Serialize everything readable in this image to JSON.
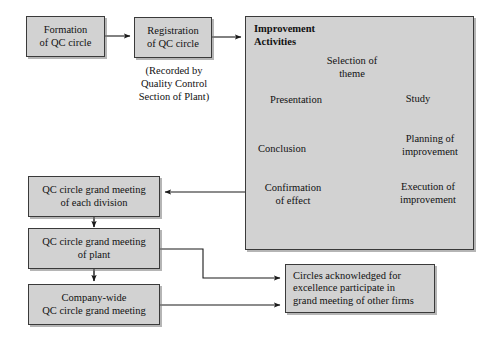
{
  "diagram": {
    "colors": {
      "box_fill": "#d2d2d2",
      "box_border": "#3a3a3a",
      "arrow": "#1a1a1a",
      "background": "#ffffff"
    }
  },
  "boxes": {
    "formation": "Formation\nof QC circle",
    "registration": "Registration\nof QC circle",
    "note_registration": "(Recorded by\nQuality Control\nSection of Plant)",
    "division_meeting": "QC circle grand meeting\nof each division",
    "plant_meeting": "QC circle grand meeting\nof plant",
    "company_meeting": "Company-wide\nQC circle grand meeting",
    "acknowledged": "Circles acknowledged for\nexcellence participate in\ngrand meeting of other firms"
  },
  "improvement": {
    "title": "Improvement\nActivities",
    "cycle": [
      {
        "label": "Selection of\ntheme"
      },
      {
        "label": "Study"
      },
      {
        "label": "Planning of\nimprovement"
      },
      {
        "label": "Execution of\nimprovement"
      },
      {
        "label": "Confirmation\nof effect"
      },
      {
        "label": "Conclusion"
      },
      {
        "label": "Presentation"
      }
    ]
  },
  "connectors": [
    {
      "name": "formation-to-registration"
    },
    {
      "name": "registration-to-improvement"
    },
    {
      "name": "improvement-to-division-meeting"
    },
    {
      "name": "division-to-plant-meeting"
    },
    {
      "name": "plant-to-company-meeting"
    },
    {
      "name": "plant-to-acknowledged"
    },
    {
      "name": "company-to-acknowledged"
    }
  ]
}
